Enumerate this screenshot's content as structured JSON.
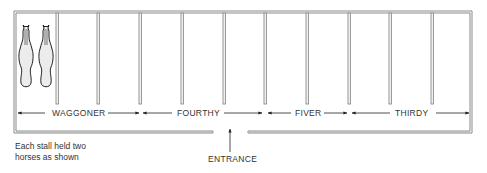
{
  "diagram": {
    "type": "stable floor plan",
    "stall_count": 11,
    "horses_per_stall": 2,
    "colors": {
      "wall": "#9a9a9a",
      "wall_edge": "#6f6f6f",
      "ink": "#222222",
      "horse_fill": "#ececec"
    }
  },
  "sections": [
    {
      "label": "WAGGONER",
      "label_x": 52,
      "from_x": 17,
      "to_x": 140
    },
    {
      "label": "FOURTHY",
      "label_x": 177,
      "from_x": 142,
      "to_x": 265
    },
    {
      "label": "FIVER",
      "label_x": 295,
      "from_x": 268,
      "to_x": 349
    },
    {
      "label": "THIRDY",
      "label_x": 395,
      "from_x": 351,
      "to_x": 470
    }
  ],
  "entrance": {
    "label": "ENTRANCE"
  },
  "note": {
    "line1": "Each stall held two",
    "line2": "horses as shown"
  }
}
